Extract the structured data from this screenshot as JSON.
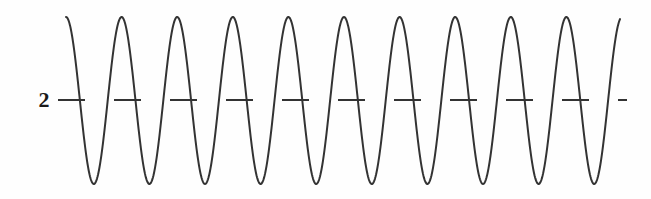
{
  "figure": {
    "background_color": "#fefefe",
    "stroke_color": "#333333",
    "label_color": "#1a1a1a",
    "width": 651,
    "height": 199
  },
  "axis": {
    "y_tick_label": "2",
    "y_tick_label_x": 44,
    "y_tick_label_y": 100
  },
  "reference_line": {
    "name": "dashed-gridline",
    "y": 100,
    "x_start": 58,
    "x_end": 627,
    "dash_length": 27,
    "gap_length": 29,
    "stroke_width": 2.1,
    "color": "#333333"
  },
  "chart_data": {
    "type": "line",
    "title": "",
    "xlabel": "",
    "ylabel": "",
    "grid": false,
    "legend": null,
    "annotations": [
      {
        "text": "2",
        "x": 44,
        "y": 100,
        "role": "y-axis-tick-label"
      }
    ],
    "axis_ranges": {
      "x_pixels": [
        66,
        620
      ],
      "y_pixels": [
        17,
        184
      ]
    },
    "waveform": {
      "shape": "sinusoid",
      "description": "High-frequency sine wave, 10 crests and 10 troughs, clipped at both ends",
      "amplitude_px": 83.5,
      "baseline_y_px": 100.5,
      "period_px": 55.6,
      "phase_start_deg": 90,
      "x_start_px": 66,
      "x_end_px": 620,
      "peak_y_px": 17,
      "trough_y_px": 184,
      "stroke_width": 2.0,
      "n_peaks": 10,
      "n_troughs": 10,
      "peak_x_positions": [
        66,
        121.6,
        177.2,
        232.8,
        288.4,
        344,
        399.6,
        455.2,
        510.8,
        566.4
      ],
      "trough_x_positions": [
        93.8,
        149.4,
        205,
        260.6,
        316.2,
        371.8,
        427.4,
        483,
        538.6,
        594.2
      ],
      "y_values_at_peaks": [
        2.9,
        2.9,
        2.9,
        2.9,
        2.9,
        2.9,
        2.9,
        2.9,
        2.9,
        2.9
      ],
      "y_values_at_troughs": [
        1.1,
        1.1,
        1.1,
        1.1,
        1.1,
        1.1,
        1.1,
        1.1,
        1.1,
        1.1
      ],
      "reference_value": 2
    }
  }
}
